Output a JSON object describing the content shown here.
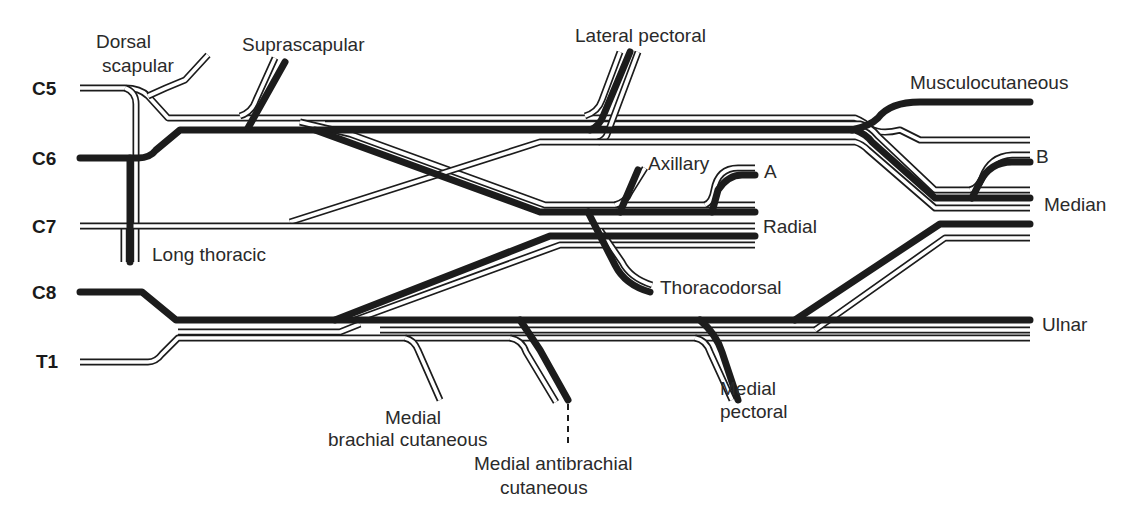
{
  "diagram": {
    "type": "brachial plexus schematic",
    "roots": [
      {
        "id": "C5",
        "label": "C5"
      },
      {
        "id": "C6",
        "label": "C6"
      },
      {
        "id": "C7",
        "label": "C7"
      },
      {
        "id": "C8",
        "label": "C8"
      },
      {
        "id": "T1",
        "label": "T1"
      }
    ],
    "nerves": {
      "dorsal_scapular": {
        "line1": "Dorsal",
        "line2": "scapular"
      },
      "suprascapular": "Suprascapular",
      "long_thoracic": "Long thoracic",
      "lateral_pectoral": "Lateral pectoral",
      "musculocutaneous": "Musculocutaneous",
      "axillary": "Axillary",
      "radial": "Radial",
      "thoracodorsal": "Thoracodorsal",
      "median": "Median",
      "ulnar": "Ulnar",
      "medial_brachial_cutaneous": {
        "line1": "Medial",
        "line2": "brachial cutaneous"
      },
      "medial_antibrachial_cutaneous": {
        "line1": "Medial antibrachial",
        "line2": "cutaneous"
      },
      "medial_pectoral": {
        "line1": "Medial",
        "line2": "pectoral"
      }
    },
    "markers": {
      "a": "A",
      "b": "B"
    },
    "legend_styles": {
      "solid_fiber": "#1c1c1c",
      "outline_fiber": "#ffffff"
    }
  }
}
